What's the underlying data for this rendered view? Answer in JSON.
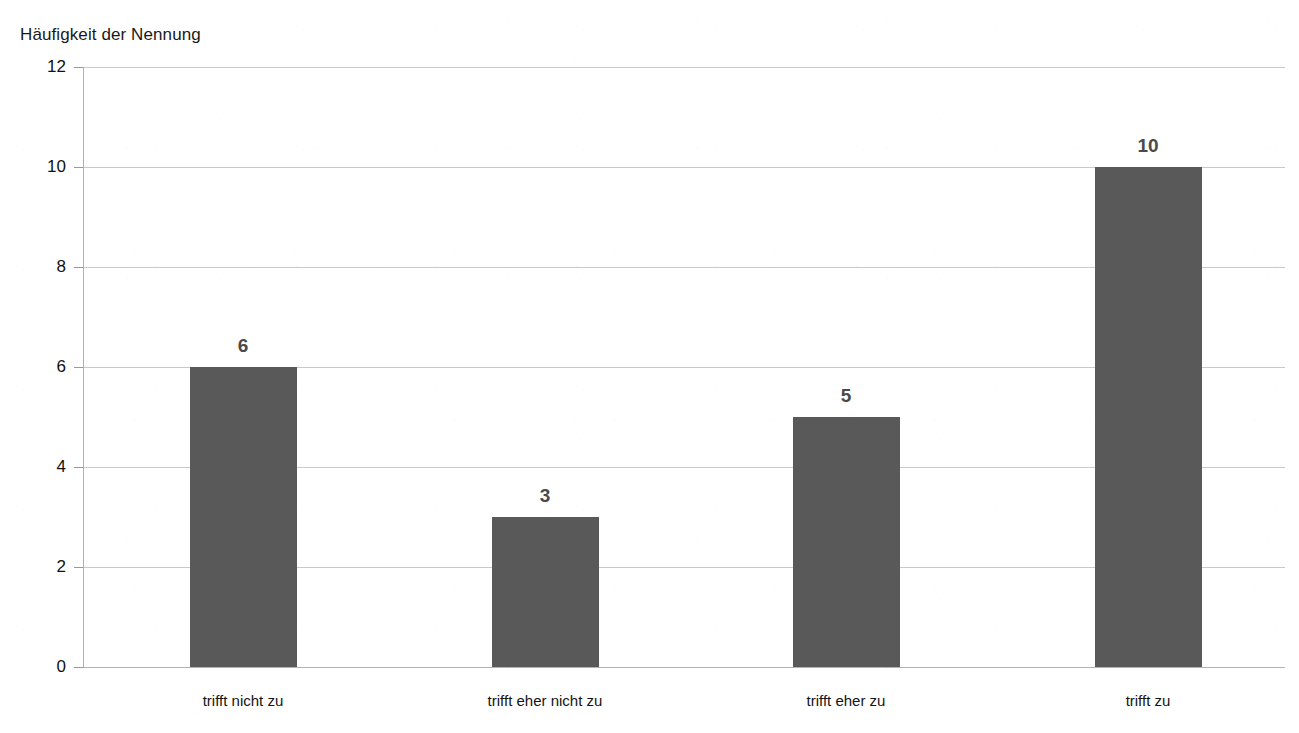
{
  "chart_data": {
    "type": "bar",
    "title": "",
    "xlabel": "",
    "ylabel": "Häufigkeit der Nennung",
    "categories": [
      "trifft nicht zu",
      "trifft eher nicht zu",
      "trifft eher zu",
      "trifft zu"
    ],
    "values": [
      6,
      3,
      5,
      10
    ],
    "ylim": [
      0,
      12
    ],
    "yticks": [
      "0",
      "2",
      "4",
      "6",
      "8",
      "10",
      "12"
    ],
    "ytick_values": [
      0,
      2,
      4,
      6,
      8,
      10,
      12
    ],
    "grid": true,
    "legend": "none",
    "data_labels": [
      "6",
      "3",
      "5",
      "10"
    ],
    "bar_color": "#595959",
    "gridline_color": "#c9c9c9",
    "data_label_color": "#4a4a4a",
    "axis_text_color": "#111111"
  },
  "axis": {
    "y_axis_title": "Häufigkeit der Nennung"
  },
  "cropped_title": {
    "text": ""
  }
}
